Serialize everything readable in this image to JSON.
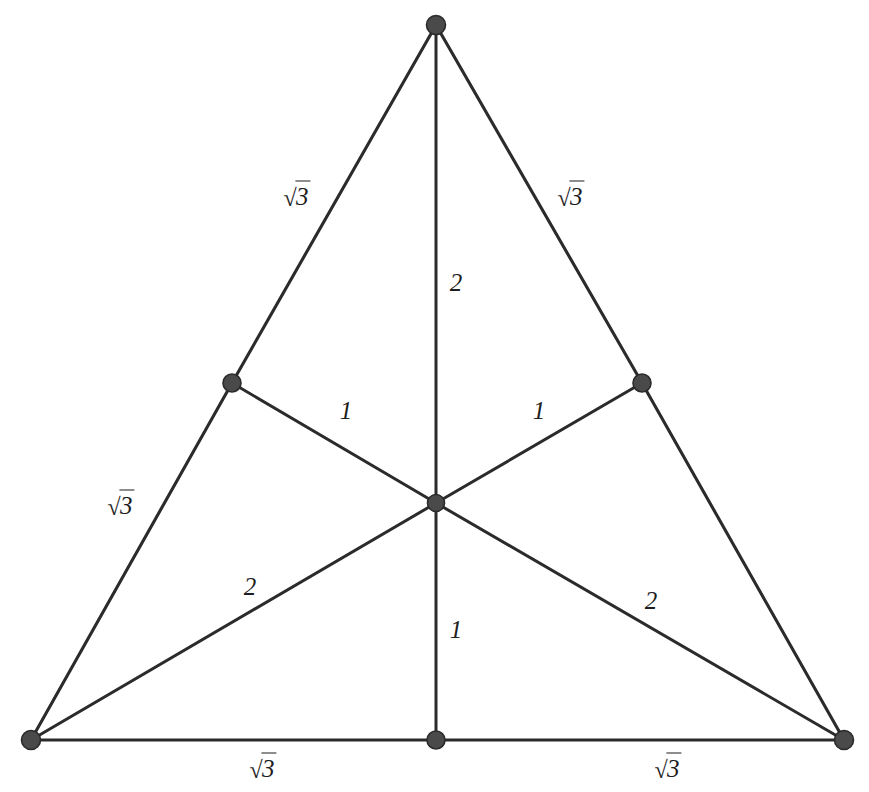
{
  "figure": {
    "background_color": "#ffffff",
    "line_color": "#2b2b2b",
    "node_fill_color": "#4a4a4a",
    "label_color": "#1d1d1d",
    "width": 869,
    "height": 792
  },
  "chart_data": {
    "type": "diagram",
    "shape": "equilateral-triangle",
    "points": [
      {
        "id": "apex",
        "role": "vertex",
        "x": 436,
        "y": 25,
        "label": ""
      },
      {
        "id": "bottom-left",
        "role": "vertex",
        "x": 31,
        "y": 740,
        "label": ""
      },
      {
        "id": "bottom-right",
        "role": "vertex",
        "x": 844,
        "y": 740,
        "label": ""
      },
      {
        "id": "left-mid",
        "role": "midpoint",
        "x": 232,
        "y": 383,
        "label": ""
      },
      {
        "id": "right-mid",
        "role": "midpoint",
        "x": 642,
        "y": 383,
        "label": ""
      },
      {
        "id": "bottom-mid",
        "role": "midpoint",
        "x": 436,
        "y": 740,
        "label": ""
      },
      {
        "id": "centroid",
        "role": "centroid",
        "x": 436,
        "y": 503,
        "label": ""
      }
    ],
    "edges": [
      {
        "id": "side-left-upper",
        "from": "apex",
        "to": "left-mid",
        "kind": "side",
        "length_label": "√3",
        "length_value": 1.732
      },
      {
        "id": "side-left-lower",
        "from": "left-mid",
        "to": "bottom-left",
        "kind": "side",
        "length_label": "√3",
        "length_value": 1.732
      },
      {
        "id": "side-right-upper",
        "from": "apex",
        "to": "right-mid",
        "kind": "side",
        "length_label": "√3",
        "length_value": 1.732
      },
      {
        "id": "side-right-lower",
        "from": "right-mid",
        "to": "bottom-right",
        "kind": "side",
        "length_label": "√3",
        "length_value": 1.732
      },
      {
        "id": "base-left",
        "from": "bottom-left",
        "to": "bottom-mid",
        "kind": "side",
        "length_label": "√3",
        "length_value": 1.732
      },
      {
        "id": "base-right",
        "from": "bottom-mid",
        "to": "bottom-right",
        "kind": "side",
        "length_label": "√3",
        "length_value": 1.732
      },
      {
        "id": "median-apex-upper",
        "from": "apex",
        "to": "centroid",
        "kind": "median",
        "length_label": "2",
        "length_value": 2
      },
      {
        "id": "median-apex-lower",
        "from": "centroid",
        "to": "bottom-mid",
        "kind": "median",
        "length_label": "1",
        "length_value": 1
      },
      {
        "id": "median-bl-outer",
        "from": "bottom-left",
        "to": "centroid",
        "kind": "median",
        "length_label": "2",
        "length_value": 2
      },
      {
        "id": "median-bl-inner",
        "from": "centroid",
        "to": "right-mid",
        "kind": "median",
        "length_label": "1",
        "length_value": 1
      },
      {
        "id": "median-br-outer",
        "from": "bottom-right",
        "to": "centroid",
        "kind": "median",
        "length_label": "2",
        "length_value": 2
      },
      {
        "id": "median-br-inner",
        "from": "centroid",
        "to": "left-mid",
        "kind": "median",
        "length_label": "1",
        "length_value": 1
      }
    ],
    "labels": [
      {
        "id": "label-side-left-upper",
        "text": "√3",
        "is_radical": true,
        "radicand": "3",
        "x": 297,
        "y": 196
      },
      {
        "id": "label-side-right-upper",
        "text": "√3",
        "is_radical": true,
        "radicand": "3",
        "x": 571,
        "y": 196
      },
      {
        "id": "label-median-top",
        "text": "2",
        "is_radical": false,
        "radicand": "",
        "x": 456,
        "y": 282
      },
      {
        "id": "label-median-left-in",
        "text": "1",
        "is_radical": false,
        "radicand": "",
        "x": 346,
        "y": 410
      },
      {
        "id": "label-median-right-in",
        "text": "1",
        "is_radical": false,
        "radicand": "",
        "x": 539,
        "y": 410
      },
      {
        "id": "label-side-left-lower",
        "text": "√3",
        "is_radical": true,
        "radicand": "3",
        "x": 121,
        "y": 505
      },
      {
        "id": "label-median-bl",
        "text": "2",
        "is_radical": false,
        "radicand": "",
        "x": 250,
        "y": 586
      },
      {
        "id": "label-median-br",
        "text": "2",
        "is_radical": false,
        "radicand": "",
        "x": 651,
        "y": 600
      },
      {
        "id": "label-median-bottom",
        "text": "1",
        "is_radical": false,
        "radicand": "",
        "x": 456,
        "y": 629
      },
      {
        "id": "label-base-left",
        "text": "√3",
        "is_radical": true,
        "radicand": "3",
        "x": 263,
        "y": 768
      },
      {
        "id": "label-base-right",
        "text": "√3",
        "is_radical": true,
        "radicand": "3",
        "x": 668,
        "y": 768
      }
    ]
  }
}
